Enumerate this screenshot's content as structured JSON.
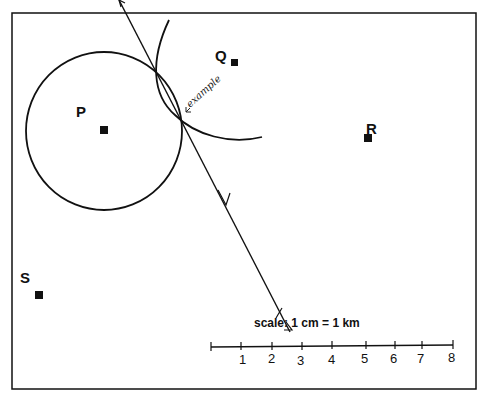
{
  "diagram": {
    "points": [
      {
        "label": "P",
        "x": 104,
        "y": 130
      },
      {
        "label": "Q",
        "x": 235,
        "y": 63
      },
      {
        "label": "R",
        "x": 368,
        "y": 138
      },
      {
        "label": "S",
        "x": 39,
        "y": 295
      }
    ],
    "circle_P": {
      "cx": 104,
      "cy": 131,
      "r": 78
    },
    "arc_Q": {
      "description": "arc centred near Q passing through intersection"
    },
    "line": {
      "from": [
        118,
        0
      ],
      "to": [
        288,
        330
      ],
      "description": "line through intersection with arrows"
    },
    "annotation": "example",
    "scale": {
      "label": "scale: 1 cm = 1 km",
      "ticks": [
        "1",
        "2",
        "3",
        "4",
        "5",
        "6",
        "7",
        "8"
      ]
    },
    "colors": {
      "ink": "#111111",
      "background": "#ffffff"
    }
  }
}
